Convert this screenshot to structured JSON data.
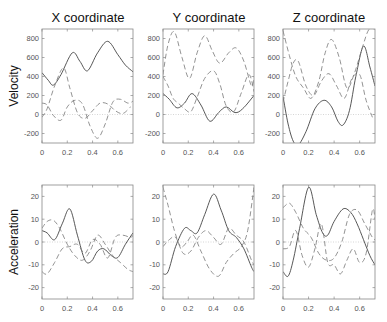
{
  "chart_data": {
    "type": "line",
    "layout": {
      "rows": 2,
      "cols": 3,
      "grid": false,
      "legend": "none"
    },
    "column_titles": [
      "X coordinate",
      "Y coordinate",
      "Z coordinate"
    ],
    "row_labels": [
      "Velocity",
      "Acceleration"
    ],
    "xlim": [
      0,
      0.72
    ],
    "xticks": [
      0,
      0.2,
      0.4,
      0.6
    ],
    "xtick_labels": [
      "0",
      "0.2",
      "0.4",
      "0.6"
    ],
    "panels": [
      {
        "row": "Velocity",
        "col": "X coordinate",
        "ylim": [
          -300,
          900
        ],
        "yticks": [
          -200,
          0,
          200,
          400,
          600,
          800
        ],
        "series": [
          {
            "name": "solid",
            "style": "solid",
            "x": [
              0,
              0.05,
              0.09,
              0.15,
              0.24,
              0.3,
              0.36,
              0.44,
              0.52,
              0.6,
              0.66,
              0.72
            ],
            "y": [
              440,
              360,
              310,
              420,
              650,
              560,
              460,
              650,
              770,
              630,
              520,
              450
            ]
          },
          {
            "name": "dashed-1",
            "style": "dashed",
            "x": [
              0,
              0.04,
              0.1,
              0.17,
              0.22,
              0.28,
              0.34,
              0.4,
              0.46,
              0.52,
              0.58,
              0.64,
              0.7
            ],
            "y": [
              -30,
              60,
              300,
              490,
              280,
              20,
              -40,
              40,
              120,
              110,
              40,
              10,
              80
            ]
          },
          {
            "name": "dashed-2",
            "style": "dashed",
            "x": [
              0,
              0.04,
              0.09,
              0.15,
              0.2,
              0.26,
              0.32,
              0.38,
              0.44,
              0.5,
              0.56,
              0.62,
              0.68,
              0.72
            ],
            "y": [
              120,
              100,
              -10,
              -60,
              80,
              150,
              110,
              -120,
              -250,
              -100,
              130,
              160,
              120,
              140
            ]
          }
        ]
      },
      {
        "row": "Velocity",
        "col": "Y coordinate",
        "ylim": [
          -300,
          900
        ],
        "yticks": [
          -200,
          0,
          200,
          400,
          600,
          800
        ],
        "series": [
          {
            "name": "solid",
            "style": "solid",
            "x": [
              0,
              0.05,
              0.11,
              0.17,
              0.23,
              0.3,
              0.37,
              0.44,
              0.5,
              0.57,
              0.63,
              0.72
            ],
            "y": [
              220,
              160,
              70,
              120,
              220,
              100,
              -70,
              20,
              80,
              20,
              60,
              200
            ]
          },
          {
            "name": "dashed-1",
            "style": "dashed",
            "x": [
              0,
              0.04,
              0.09,
              0.15,
              0.21,
              0.27,
              0.33,
              0.39,
              0.45,
              0.52,
              0.58,
              0.64,
              0.7,
              0.72
            ],
            "y": [
              420,
              740,
              870,
              600,
              380,
              650,
              830,
              670,
              540,
              650,
              700,
              560,
              300,
              400
            ]
          },
          {
            "name": "dashed-2",
            "style": "dashed",
            "x": [
              0,
              0.04,
              0.08,
              0.12,
              0.17,
              0.22,
              0.27,
              0.33,
              0.4,
              0.45,
              0.5,
              0.56,
              0.62,
              0.68,
              0.72
            ],
            "y": [
              400,
              300,
              170,
              120,
              60,
              30,
              180,
              380,
              460,
              320,
              90,
              30,
              230,
              420,
              240
            ]
          }
        ]
      },
      {
        "row": "Velocity",
        "col": "Z coordinate",
        "ylim": [
          -300,
          900
        ],
        "yticks": [
          -200,
          0,
          200,
          400,
          600,
          800
        ],
        "series": [
          {
            "name": "solid",
            "style": "solid",
            "x": [
              0,
              0.04,
              0.08,
              0.12,
              0.18,
              0.25,
              0.32,
              0.38,
              0.43,
              0.47,
              0.52,
              0.57,
              0.63,
              0.68,
              0.72
            ],
            "y": [
              190,
              -100,
              -280,
              -320,
              -180,
              60,
              150,
              80,
              -70,
              -110,
              40,
              400,
              720,
              500,
              300
            ]
          },
          {
            "name": "dashed-1",
            "style": "dashed",
            "x": [
              0,
              0.05,
              0.1,
              0.16,
              0.22,
              0.28,
              0.33,
              0.38,
              0.44,
              0.5,
              0.56,
              0.62,
              0.67,
              0.72
            ],
            "y": [
              880,
              620,
              400,
              280,
              170,
              350,
              650,
              790,
              600,
              280,
              440,
              700,
              890,
              900
            ]
          },
          {
            "name": "dashed-2",
            "style": "dashed",
            "x": [
              0,
              0.04,
              0.08,
              0.12,
              0.18,
              0.24,
              0.3,
              0.36,
              0.42,
              0.48,
              0.54,
              0.6,
              0.65,
              0.7
            ],
            "y": [
              130,
              350,
              540,
              560,
              300,
              200,
              350,
              430,
              300,
              170,
              380,
              420,
              150,
              -30
            ]
          }
        ]
      },
      {
        "row": "Acceleration",
        "col": "X coordinate",
        "ylim": [
          -25,
          25
        ],
        "yticks": [
          -20,
          -10,
          0,
          10,
          20
        ],
        "series": [
          {
            "name": "solid",
            "style": "solid",
            "x": [
              0,
              0.04,
              0.1,
              0.16,
              0.22,
              0.28,
              0.34,
              0.39,
              0.44,
              0.49,
              0.55,
              0.6,
              0.66,
              0.72
            ],
            "y": [
              5,
              4,
              1,
              8,
              14.5,
              3,
              -8,
              -8.5,
              -4,
              -3,
              -6,
              -6.8,
              -1,
              4
            ]
          },
          {
            "name": "dashed-1",
            "style": "dashed",
            "x": [
              0,
              0.04,
              0.09,
              0.14,
              0.2,
              0.26,
              0.32,
              0.38,
              0.44,
              0.5,
              0.56,
              0.62,
              0.68,
              0.72
            ],
            "y": [
              6,
              9,
              9.5,
              6,
              -1,
              -6,
              -8,
              -4,
              3,
              -1,
              -6,
              -9,
              -12,
              -13
            ]
          },
          {
            "name": "dashed-2",
            "style": "dashed",
            "x": [
              0,
              0.04,
              0.1,
              0.16,
              0.22,
              0.28,
              0.34,
              0.4,
              0.46,
              0.52,
              0.58,
              0.64,
              0.7,
              0.72
            ],
            "y": [
              -13,
              -14,
              -9,
              -3,
              -2,
              -1,
              -5,
              1,
              -1,
              -7,
              2,
              3,
              2,
              3
            ]
          }
        ]
      },
      {
        "row": "Acceleration",
        "col": "Y coordinate",
        "ylim": [
          -25,
          25
        ],
        "yticks": [
          -20,
          -10,
          0,
          10,
          20
        ],
        "series": [
          {
            "name": "solid",
            "style": "solid",
            "x": [
              0,
              0.04,
              0.1,
              0.17,
              0.22,
              0.27,
              0.33,
              0.4,
              0.46,
              0.52,
              0.58,
              0.64,
              0.7,
              0.72
            ],
            "y": [
              -14,
              -13,
              -2,
              6,
              5,
              4,
              12,
              21,
              14,
              5,
              2,
              -3,
              -11,
              -13
            ]
          },
          {
            "name": "dashed-1",
            "style": "dashed",
            "x": [
              0,
              0.04,
              0.09,
              0.14,
              0.19,
              0.24,
              0.3,
              0.37,
              0.44,
              0.5,
              0.56,
              0.62,
              0.67,
              0.72
            ],
            "y": [
              24,
              16,
              5,
              -2,
              0,
              3,
              -4,
              -12,
              -15,
              -9,
              -5,
              -2,
              5,
              24
            ]
          },
          {
            "name": "dashed-2",
            "style": "dashed",
            "x": [
              0,
              0.05,
              0.1,
              0.16,
              0.22,
              0.28,
              0.34,
              0.4,
              0.46,
              0.52,
              0.58,
              0.64,
              0.7,
              0.72
            ],
            "y": [
              -2,
              1,
              2,
              -5,
              -4,
              2,
              5,
              2,
              -1,
              6,
              3,
              0,
              -8,
              -10
            ]
          }
        ]
      },
      {
        "row": "Acceleration",
        "col": "Z coordinate",
        "ylim": [
          -25,
          25
        ],
        "yticks": [
          -20,
          -10,
          0,
          10,
          20
        ],
        "series": [
          {
            "name": "solid",
            "style": "solid",
            "x": [
              0,
              0.04,
              0.08,
              0.13,
              0.2,
              0.26,
              0.31,
              0.35,
              0.4,
              0.47,
              0.53,
              0.58,
              0.63,
              0.68,
              0.72
            ],
            "y": [
              -13,
              -15,
              -8,
              6,
              24,
              12,
              4,
              3,
              9,
              14.5,
              13,
              8,
              1,
              -6,
              -10
            ]
          },
          {
            "name": "dashed-1",
            "style": "dashed",
            "x": [
              0,
              0.05,
              0.1,
              0.16,
              0.22,
              0.28,
              0.34,
              0.4,
              0.46,
              0.52,
              0.58,
              0.64,
              0.7,
              0.72
            ],
            "y": [
              15,
              17,
              13,
              6,
              2,
              -5,
              -8,
              -7,
              0,
              12,
              14,
              8,
              2,
              1
            ]
          },
          {
            "name": "dashed-2",
            "style": "dashed",
            "x": [
              0,
              0.05,
              0.1,
              0.15,
              0.2,
              0.25,
              0.3,
              0.35,
              0.4,
              0.45,
              0.5,
              0.55,
              0.6,
              0.65,
              0.7,
              0.72
            ],
            "y": [
              -3,
              -2,
              5,
              -6,
              -11,
              -3,
              8,
              -9,
              -10,
              -14,
              -8,
              -3,
              -9,
              -5,
              14,
              10
            ]
          }
        ]
      }
    ]
  }
}
